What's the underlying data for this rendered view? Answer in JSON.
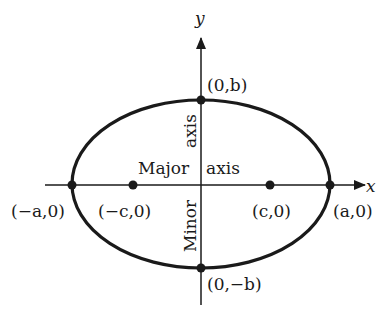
{
  "diagram": {
    "type": "ellipse",
    "colors": {
      "stroke": "#1a1a1a",
      "background": "#ffffff"
    },
    "axes": {
      "x_label": "x",
      "y_label": "y"
    },
    "points": [
      {
        "id": "vertex-left",
        "label": "(−a,0)"
      },
      {
        "id": "focus-left",
        "label": "(−c,0)"
      },
      {
        "id": "focus-right",
        "label": "(c,0)"
      },
      {
        "id": "vertex-right",
        "label": "(a,0)"
      },
      {
        "id": "covertex-top",
        "label": "(0,b)"
      },
      {
        "id": "covertex-bottom",
        "label": "(0,−b)"
      }
    ],
    "annotations": {
      "major_word": "Major",
      "major_axis_word": "axis",
      "minor_word": "Minor",
      "minor_axis_word": "axis"
    }
  }
}
